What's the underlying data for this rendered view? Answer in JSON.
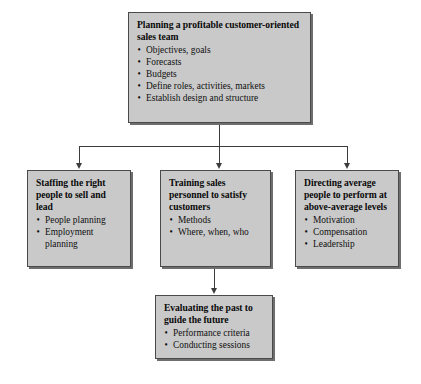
{
  "diagram": {
    "colors": {
      "box_fill": "#c9c9c9",
      "box_border": "#4a4a4a",
      "box_shadow": "#6e6e6e",
      "connector": "#3c3c3c",
      "background": "#ffffff",
      "text": "#0a0a0a"
    },
    "bullet_glyph": "•",
    "nodes": {
      "planning": {
        "title": "Planning a profitable customer-oriented sales team",
        "items": [
          "Objectives, goals",
          "Forecasts",
          "Budgets",
          "Define roles, activities, markets",
          "Establish design and structure"
        ]
      },
      "staffing": {
        "title": "Staffing the right people to sell and lead",
        "items": [
          "People planning",
          "Employment planning"
        ]
      },
      "training": {
        "title": "Training sales personnel to satisfy customers",
        "items": [
          "Methods",
          "Where, when, who"
        ]
      },
      "directing": {
        "title": "Directing average people to perform at above-average levels",
        "items": [
          "Motivation",
          "Compensation",
          "Leadership"
        ]
      },
      "evaluating": {
        "title": "Evaluating the past to guide the future",
        "items": [
          "Performance criteria",
          "Conducting sessions"
        ]
      }
    },
    "connectors": [
      {
        "name": "planning-to-branch-bar",
        "from": "planning",
        "to": "branch-bar"
      },
      {
        "name": "branch-to-staffing",
        "from": "branch-bar",
        "to": "staffing"
      },
      {
        "name": "branch-to-training",
        "from": "branch-bar",
        "to": "training"
      },
      {
        "name": "branch-to-directing",
        "from": "branch-bar",
        "to": "directing"
      },
      {
        "name": "training-to-evaluating",
        "from": "training",
        "to": "evaluating"
      }
    ]
  }
}
